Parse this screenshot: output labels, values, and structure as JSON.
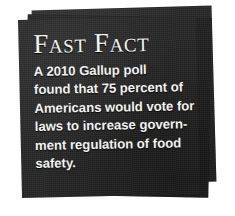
{
  "callout": {
    "title": "Fast Fact",
    "body_lines": [
      "A 2010 Gallup poll",
      "found that 75 percent of",
      "Americans would vote for",
      "laws to increase govern-",
      "ment regulation of food",
      "safety."
    ],
    "body_text": "A 2010 Gallup poll found that 75 percent of Americans would vote for laws to increase government regulation of food safety.",
    "colors": {
      "card": "#262626",
      "card_back": "#282828",
      "card_mid": "#202020",
      "text": "#f2f2f0",
      "page_background": "#ffffff"
    }
  }
}
